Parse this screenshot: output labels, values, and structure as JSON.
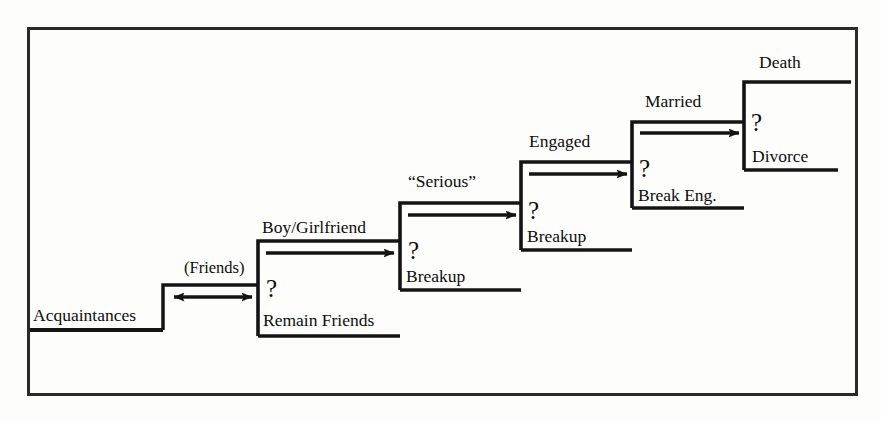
{
  "figure": {
    "type": "staircase-flow-diagram",
    "title_text": "",
    "frame": {
      "x": 27,
      "y": 27,
      "width": 830,
      "height": 368
    },
    "colors": {
      "line": "#141414",
      "text": "#0d0d0d",
      "background": "#fdfdfc"
    }
  },
  "base": {
    "label": "Acquaintances",
    "tread_y": 330,
    "tread_x0": 30,
    "tread_x1": 163
  },
  "transitions": [
    {
      "id": "friends",
      "label": "(Friends)",
      "arrow": "double",
      "x0": 170,
      "x1": 255,
      "y": 297
    }
  ],
  "steps": [
    {
      "id": "boyfriend-girlfriend",
      "stage_label": "Boy/Girlfriend",
      "branch_symbol": "?",
      "outcome_label": "Remain Friends",
      "arrow": "single",
      "riser_x": 258,
      "top_tread_y": 241,
      "bottom_tread_y": 336,
      "tread_x1": 400,
      "arrow_y": 253
    },
    {
      "id": "serious",
      "stage_label": "“Serious”",
      "branch_symbol": "?",
      "outcome_label": "Breakup",
      "arrow": "single",
      "riser_x": 400,
      "top_tread_y": 203,
      "bottom_tread_y": 290,
      "tread_x1": 521,
      "arrow_y": 215
    },
    {
      "id": "engaged",
      "stage_label": "Engaged",
      "branch_symbol": "?",
      "outcome_label": "Breakup",
      "arrow": "single",
      "riser_x": 521,
      "top_tread_y": 162,
      "bottom_tread_y": 250,
      "tread_x1": 632,
      "arrow_y": 174
    },
    {
      "id": "married",
      "stage_label": "Married",
      "branch_symbol": "?",
      "outcome_label": "Break Eng.",
      "arrow": "single",
      "riser_x": 632,
      "top_tread_y": 122,
      "bottom_tread_y": 208,
      "tread_x1": 744,
      "arrow_y": 133
    },
    {
      "id": "death",
      "stage_label": "Death",
      "branch_symbol": "?",
      "outcome_label": "Divorce",
      "arrow": "none",
      "riser_x": 744,
      "top_tread_y": 82,
      "bottom_tread_y": 170,
      "tread_x1": 851,
      "arrow_y": null
    }
  ],
  "labels": {
    "acquaintances": "Acquaintances",
    "friends": "(Friends)",
    "boy_girlfriend": "Boy/Girlfriend",
    "remain_friends": "Remain Friends",
    "serious": "“Serious”",
    "breakup_1": "Breakup",
    "engaged": "Engaged",
    "breakup_2": "Breakup",
    "married": "Married",
    "break_eng": "Break Eng.",
    "death": "Death",
    "divorce": "Divorce",
    "q1": "?",
    "q2": "?",
    "q3": "?",
    "q4": "?",
    "q5": "?"
  }
}
